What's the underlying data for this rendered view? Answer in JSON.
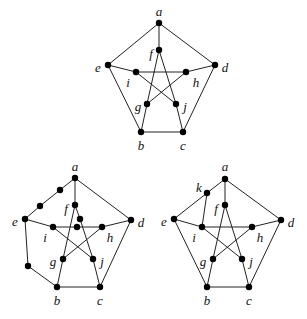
{
  "figure": {
    "graphs": [
      {
        "id": "petersen",
        "name": "petersen-graph",
        "vertices": [
          {
            "id": "a",
            "label": "a",
            "x": 159,
            "y": 23,
            "lx": 159,
            "ly": 13
          },
          {
            "id": "b",
            "label": "b",
            "x": 141,
            "y": 132,
            "lx": 141,
            "ly": 147
          },
          {
            "id": "c",
            "label": "c",
            "x": 183,
            "y": 132,
            "lx": 183,
            "ly": 147
          },
          {
            "id": "d",
            "label": "d",
            "x": 215,
            "y": 65,
            "lx": 225,
            "ly": 69
          },
          {
            "id": "e",
            "label": "e",
            "x": 108,
            "y": 65,
            "lx": 98,
            "ly": 69
          },
          {
            "id": "f",
            "label": "f",
            "x": 159,
            "y": 50,
            "lx": 151,
            "ly": 55
          },
          {
            "id": "g",
            "label": "g",
            "x": 147,
            "y": 104,
            "lx": 138,
            "ly": 108
          },
          {
            "id": "h",
            "label": "h",
            "x": 186,
            "y": 72,
            "lx": 196,
            "ly": 84
          },
          {
            "id": "i",
            "label": "i",
            "x": 136,
            "y": 72,
            "lx": 128,
            "ly": 84
          },
          {
            "id": "j",
            "label": "j",
            "x": 176,
            "y": 104,
            "lx": 185,
            "ly": 108
          }
        ],
        "edges": [
          [
            "a",
            "e"
          ],
          [
            "a",
            "d"
          ],
          [
            "a",
            "f"
          ],
          [
            "e",
            "b"
          ],
          [
            "d",
            "c"
          ],
          [
            "b",
            "c"
          ],
          [
            "e",
            "i"
          ],
          [
            "d",
            "h"
          ],
          [
            "b",
            "g"
          ],
          [
            "c",
            "j"
          ],
          [
            "f",
            "g"
          ],
          [
            "f",
            "j"
          ],
          [
            "i",
            "h"
          ],
          [
            "i",
            "j"
          ],
          [
            "g",
            "h"
          ]
        ],
        "extra_points": []
      },
      {
        "id": "subdivision",
        "name": "subdivided-petersen-graph",
        "vertices": [
          {
            "id": "a",
            "label": "a",
            "x": 75,
            "y": 178,
            "lx": 75,
            "ly": 168
          },
          {
            "id": "b",
            "label": "b",
            "x": 57,
            "y": 287,
            "lx": 57,
            "ly": 302
          },
          {
            "id": "c",
            "label": "c",
            "x": 100,
            "y": 287,
            "lx": 100,
            "ly": 302
          },
          {
            "id": "d",
            "label": "d",
            "x": 131,
            "y": 220,
            "lx": 141,
            "ly": 224
          },
          {
            "id": "e",
            "label": "e",
            "x": 25,
            "y": 219,
            "lx": 15,
            "ly": 223
          },
          {
            "id": "f",
            "label": "f",
            "x": 75,
            "y": 205,
            "lx": 66,
            "ly": 210
          },
          {
            "id": "g",
            "label": "g",
            "x": 63,
            "y": 259,
            "lx": 53,
            "ly": 263
          },
          {
            "id": "h",
            "label": "h",
            "x": 102,
            "y": 227,
            "lx": 110,
            "ly": 239
          },
          {
            "id": "i",
            "label": "i",
            "x": 53,
            "y": 227,
            "lx": 45,
            "ly": 239
          },
          {
            "id": "j",
            "label": "j",
            "x": 93,
            "y": 259,
            "lx": 102,
            "ly": 263
          },
          {
            "id": "s1",
            "label": "",
            "x": 60,
            "y": 190
          },
          {
            "id": "s2",
            "label": "",
            "x": 40,
            "y": 206
          },
          {
            "id": "s3",
            "label": "",
            "x": 80,
            "y": 219
          },
          {
            "id": "s4",
            "label": "",
            "x": 77,
            "y": 227
          },
          {
            "id": "s5",
            "label": "",
            "x": 28,
            "y": 266
          }
        ],
        "edges": [
          [
            "a",
            "s1"
          ],
          [
            "s1",
            "s2"
          ],
          [
            "s2",
            "e"
          ],
          [
            "a",
            "d"
          ],
          [
            "a",
            "f"
          ],
          [
            "e",
            "s5"
          ],
          [
            "s5",
            "b"
          ],
          [
            "d",
            "c"
          ],
          [
            "b",
            "c"
          ],
          [
            "e",
            "i"
          ],
          [
            "d",
            "h"
          ],
          [
            "b",
            "g"
          ],
          [
            "c",
            "j"
          ],
          [
            "f",
            "g"
          ],
          [
            "f",
            "s3"
          ],
          [
            "s3",
            "j"
          ],
          [
            "i",
            "s4"
          ],
          [
            "s4",
            "h"
          ],
          [
            "i",
            "j"
          ],
          [
            "g",
            "h"
          ]
        ]
      },
      {
        "id": "extra-vertex",
        "name": "petersen-with-vertex-k",
        "vertices": [
          {
            "id": "a",
            "label": "a",
            "x": 225,
            "y": 179,
            "lx": 225,
            "ly": 168
          },
          {
            "id": "b",
            "label": "b",
            "x": 207,
            "y": 287,
            "lx": 207,
            "ly": 302
          },
          {
            "id": "c",
            "label": "c",
            "x": 249,
            "y": 287,
            "lx": 249,
            "ly": 302
          },
          {
            "id": "d",
            "label": "d",
            "x": 281,
            "y": 220,
            "lx": 291,
            "ly": 224
          },
          {
            "id": "e",
            "label": "e",
            "x": 174,
            "y": 219,
            "lx": 164,
            "ly": 223
          },
          {
            "id": "f",
            "label": "f",
            "x": 225,
            "y": 205,
            "lx": 216,
            "ly": 210
          },
          {
            "id": "g",
            "label": "g",
            "x": 213,
            "y": 259,
            "lx": 203,
            "ly": 263
          },
          {
            "id": "h",
            "label": "h",
            "x": 252,
            "y": 227,
            "lx": 260,
            "ly": 239
          },
          {
            "id": "i",
            "label": "i",
            "x": 202,
            "y": 227,
            "lx": 194,
            "ly": 239
          },
          {
            "id": "j",
            "label": "j",
            "x": 242,
            "y": 259,
            "lx": 251,
            "ly": 263
          },
          {
            "id": "k",
            "label": "k",
            "x": 207,
            "y": 193,
            "lx": 199,
            "ly": 189
          }
        ],
        "edges": [
          [
            "a",
            "k"
          ],
          [
            "k",
            "e"
          ],
          [
            "k",
            "i"
          ],
          [
            "a",
            "d"
          ],
          [
            "a",
            "f"
          ],
          [
            "e",
            "b"
          ],
          [
            "d",
            "c"
          ],
          [
            "b",
            "c"
          ],
          [
            "e",
            "i"
          ],
          [
            "d",
            "h"
          ],
          [
            "b",
            "g"
          ],
          [
            "c",
            "j"
          ],
          [
            "f",
            "g"
          ],
          [
            "f",
            "j"
          ],
          [
            "i",
            "h"
          ],
          [
            "i",
            "j"
          ],
          [
            "g",
            "h"
          ]
        ]
      }
    ]
  }
}
